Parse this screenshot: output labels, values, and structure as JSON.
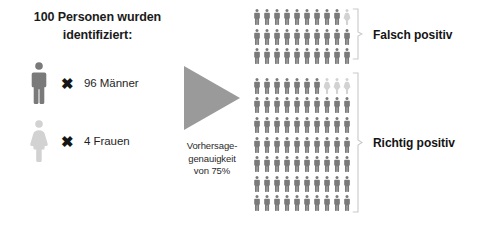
{
  "title": "100 Personen wurden identifiziert:",
  "legend": [
    {
      "icon": "male-person-icon",
      "times_symbol": "✖",
      "label": "96 Männer",
      "count": 96,
      "color": "#7a7a7a"
    },
    {
      "icon": "female-person-icon",
      "times_symbol": "✖",
      "label": "4 Frauen",
      "count": 4,
      "color": "#d2d2d2"
    }
  ],
  "arrow": {
    "icon": "right-triangle-arrow-icon",
    "caption": "Vorhersage-\ngenauigkeit\nvon 75%",
    "caption_lines": [
      "Vorhersage-",
      "genauigkeit",
      "von 75%"
    ],
    "accuracy_percent": 75,
    "color": "#9a9a9a"
  },
  "groups": [
    {
      "name": "falsch-positiv",
      "label": "Falsch positiv",
      "rows": 3,
      "columns": 10,
      "total_icons": 30,
      "female_icons": 1,
      "male_icons": 29,
      "female_positions": [
        [
          0,
          9
        ]
      ]
    },
    {
      "name": "richtig-positiv",
      "label": "Richtig positiv",
      "rows": 7,
      "columns": 10,
      "total_icons": 70,
      "female_icons": 3,
      "male_icons": 67,
      "female_positions": [
        [
          0,
          7
        ],
        [
          0,
          8
        ],
        [
          0,
          9
        ]
      ]
    }
  ],
  "colors": {
    "male": "#7a7a7a",
    "female": "#d2d2d2",
    "arrow": "#9a9a9a",
    "bracket": "#c9c9c9",
    "text": "#1b1b1b",
    "background": "#ffffff"
  }
}
